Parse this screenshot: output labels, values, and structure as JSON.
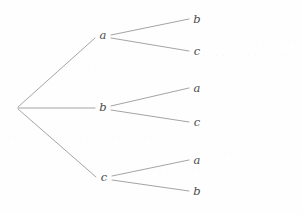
{
  "figure": {
    "kind": "tree-diagram",
    "background_color": "#fefefe",
    "edge_color": "#8d8d8d",
    "label_color": "#4a4a4a",
    "edge_width": 0.8
  },
  "root": {
    "label": "",
    "x": 17,
    "y": 108
  },
  "level1": [
    {
      "label": "a",
      "x": 103,
      "y": 36
    },
    {
      "label": "b",
      "x": 103,
      "y": 108
    },
    {
      "label": "c",
      "x": 104,
      "y": 178
    }
  ],
  "level2": [
    {
      "label": "b",
      "x": 197,
      "y": 20,
      "parent": "a"
    },
    {
      "label": "c",
      "x": 197,
      "y": 52,
      "parent": "a"
    },
    {
      "label": "a",
      "x": 197,
      "y": 89,
      "parent": "b"
    },
    {
      "label": "c",
      "x": 197,
      "y": 123,
      "parent": "b"
    },
    {
      "label": "a",
      "x": 197,
      "y": 161,
      "parent": "c"
    },
    {
      "label": "b",
      "x": 197,
      "y": 192,
      "parent": "c"
    }
  ],
  "edges": [
    {
      "name": "root-to-a",
      "x1": 18,
      "y1": 107,
      "x2": 95,
      "y2": 38
    },
    {
      "name": "root-to-b",
      "x1": 18,
      "y1": 108,
      "x2": 95,
      "y2": 108
    },
    {
      "name": "root-to-c",
      "x1": 18,
      "y1": 109,
      "x2": 96,
      "y2": 177
    },
    {
      "name": "a-to-b",
      "x1": 111,
      "y1": 35,
      "x2": 189,
      "y2": 19
    },
    {
      "name": "a-to-c",
      "x1": 111,
      "y1": 38,
      "x2": 189,
      "y2": 51
    },
    {
      "name": "b-to-a",
      "x1": 111,
      "y1": 106,
      "x2": 189,
      "y2": 88
    },
    {
      "name": "b-to-c",
      "x1": 111,
      "y1": 110,
      "x2": 189,
      "y2": 122
    },
    {
      "name": "c-to-a",
      "x1": 112,
      "y1": 176,
      "x2": 189,
      "y2": 160
    },
    {
      "name": "c-to-b",
      "x1": 112,
      "y1": 180,
      "x2": 189,
      "y2": 191
    }
  ],
  "bleedthrough": [
    {
      "text": "· · · · · · · · · · · · · ·",
      "x": 210,
      "y": 38
    },
    {
      "text": "· · · · · · · · · · · · · · · · ·",
      "x": 196,
      "y": 52
    },
    {
      "text": "· · · · · · · · · · · · · · · · · · · · · · · ·",
      "x": 10,
      "y": 66
    },
    {
      "text": "· · · · · · · · · · · · · · · · · · · · · · · · · · · ·",
      "x": 8,
      "y": 134
    },
    {
      "text": "· · · · · · · · · · · · · · · ·",
      "x": 198,
      "y": 150
    },
    {
      "text": "· · · · · · · · · · · · · · · · · · · · · ·",
      "x": 62,
      "y": 166
    }
  ]
}
